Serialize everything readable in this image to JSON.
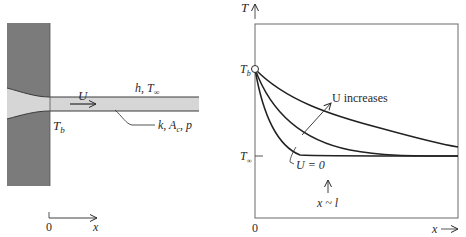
{
  "left_panel": {
    "velocity_label": "U",
    "ambient_label": "h, T",
    "ambient_sub": "∞",
    "property_label_k": "k, A",
    "property_sub_c": "c",
    "property_label_p": ", p",
    "base_temp_label": "T",
    "base_temp_sub": "b",
    "axis_origin": "0",
    "axis_label": "x"
  },
  "right_panel": {
    "y_axis_label": "T",
    "tb_label": "T",
    "tb_sub": "b",
    "tinf_label": "T",
    "tinf_sub": "∞",
    "u_increases_label": "U increases",
    "u_zero_label": "U = 0",
    "x_l_label": "x ~ l",
    "x_origin": "0",
    "x_axis_label": "x"
  },
  "colors": {
    "wall": "#7b7b7b",
    "fin": "#d6d6d6",
    "line": "#2a2a2a",
    "frame": "#6a6a6a"
  }
}
